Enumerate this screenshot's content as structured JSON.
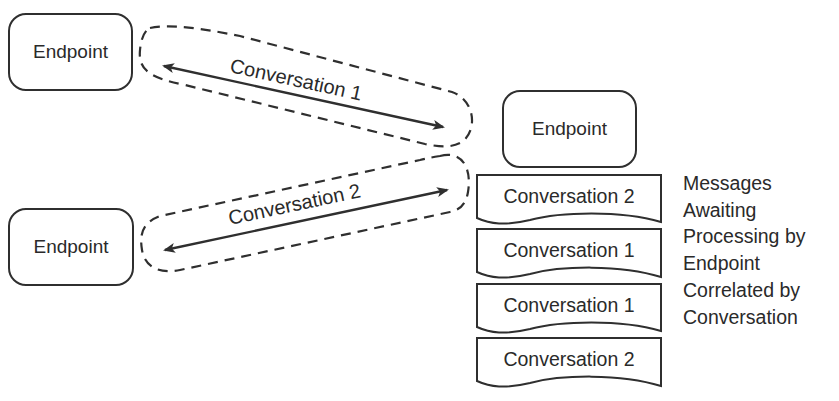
{
  "endpoints": [
    {
      "label": "Endpoint"
    },
    {
      "label": "Endpoint"
    },
    {
      "label": "Endpoint"
    }
  ],
  "conversations": [
    {
      "label": "Conversation 1"
    },
    {
      "label": "Conversation 2"
    }
  ],
  "message_queue": [
    {
      "label": "Conversation 2"
    },
    {
      "label": "Conversation 1"
    },
    {
      "label": "Conversation 1"
    },
    {
      "label": "Conversation 2"
    }
  ],
  "annotation": {
    "lines": [
      "Messages",
      "Awaiting",
      "Processing by",
      "Endpoint",
      "Correlated by",
      "Conversation"
    ]
  },
  "colors": {
    "stroke": "#2f2f2f",
    "background": "#ffffff"
  }
}
